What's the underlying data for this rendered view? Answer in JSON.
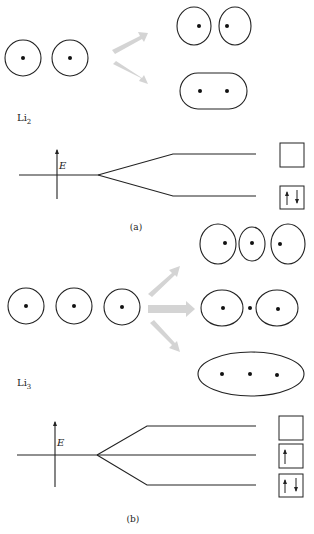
{
  "panel_a": {
    "molecule_label": "Li",
    "molecule_subscript": "2",
    "energy_axis_label": "E",
    "caption": "(a)",
    "atoms": 2,
    "orbitals": [
      {
        "name": "antibonding",
        "occupancy": "empty",
        "spins": ""
      },
      {
        "name": "bonding",
        "occupancy": "paired",
        "spins": "↑↓"
      }
    ]
  },
  "panel_b": {
    "molecule_label": "Li",
    "molecule_subscript": "3",
    "energy_axis_label": "E",
    "caption": "(b)",
    "atoms": 3,
    "orbitals": [
      {
        "name": "antibonding",
        "occupancy": "empty",
        "spins": ""
      },
      {
        "name": "nonbonding",
        "occupancy": "single",
        "spins": "↑"
      },
      {
        "name": "bonding",
        "occupancy": "paired",
        "spins": "↑↓"
      }
    ]
  },
  "colors": {
    "line": "#222222",
    "arrow_fill": "#d4d4d4"
  }
}
